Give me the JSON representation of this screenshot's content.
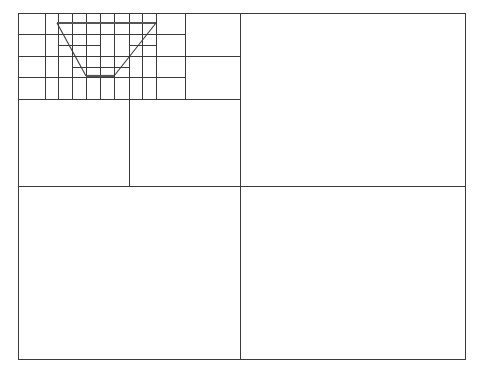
{
  "diagram": {
    "type": "quadtree-subdivision",
    "size": {
      "width": 481,
      "height": 376
    },
    "colors": {
      "line": "#3a3a3a",
      "shape_bold": "#555555",
      "background": "#ffffff"
    },
    "outer_border": {
      "x": 18,
      "y": 13,
      "width": 447,
      "height": 346
    },
    "lines": [
      {
        "id": "l1-v",
        "x1": 240,
        "y1": 13,
        "x2": 240,
        "y2": 359
      },
      {
        "id": "l1-h",
        "x1": 18,
        "y1": 186,
        "x2": 465,
        "y2": 186
      },
      {
        "id": "l2-v",
        "x1": 129,
        "y1": 13,
        "x2": 129,
        "y2": 186
      },
      {
        "id": "l2-h",
        "x1": 18,
        "y1": 99,
        "x2": 240,
        "y2": 99
      },
      {
        "id": "l3-v-right",
        "x1": 185,
        "y1": 13,
        "x2": 185,
        "y2": 99
      },
      {
        "id": "l3-h-full",
        "x1": 18,
        "y1": 56,
        "x2": 240,
        "y2": 56
      },
      {
        "id": "l3-v-left",
        "x1": 72,
        "y1": 13,
        "x2": 72,
        "y2": 99
      },
      {
        "id": "l4-v-45",
        "x1": 45,
        "y1": 13,
        "x2": 45,
        "y2": 99
      },
      {
        "id": "l4-v-100",
        "x1": 100,
        "y1": 13,
        "x2": 100,
        "y2": 99
      },
      {
        "id": "l4-v-156",
        "x1": 156,
        "y1": 13,
        "x2": 156,
        "y2": 99
      },
      {
        "id": "l4-h-34",
        "x1": 18,
        "y1": 34,
        "x2": 185,
        "y2": 34
      },
      {
        "id": "l4-h-77",
        "x1": 18,
        "y1": 77,
        "x2": 185,
        "y2": 77
      },
      {
        "id": "l5-v-58",
        "x1": 58,
        "y1": 13,
        "x2": 58,
        "y2": 99
      },
      {
        "id": "l5-v-86",
        "x1": 86,
        "y1": 13,
        "x2": 86,
        "y2": 99
      },
      {
        "id": "l5-v-114",
        "x1": 114,
        "y1": 13,
        "x2": 114,
        "y2": 99
      },
      {
        "id": "l5-v-142",
        "x1": 142,
        "y1": 13,
        "x2": 142,
        "y2": 99
      },
      {
        "id": "l5-h-45a",
        "x1": 58,
        "y1": 45,
        "x2": 100,
        "y2": 45
      },
      {
        "id": "l5-h-45b",
        "x1": 129,
        "y1": 45,
        "x2": 156,
        "y2": 45
      },
      {
        "id": "l5-h-67",
        "x1": 72,
        "y1": 67,
        "x2": 129,
        "y2": 67
      }
    ],
    "trapezoid": {
      "label": "trapezoid-shape",
      "top_left": [
        57,
        23
      ],
      "top_right": [
        156,
        23
      ],
      "bottom_right": [
        114,
        76
      ],
      "bottom_left": [
        86,
        76
      ]
    }
  }
}
